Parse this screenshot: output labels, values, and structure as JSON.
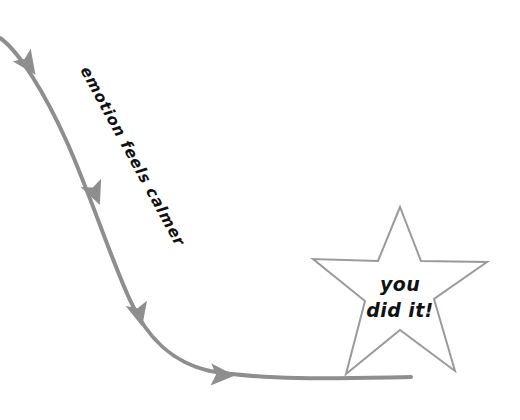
{
  "canvas": {
    "width": 520,
    "height": 420,
    "background_color": "#ffffff"
  },
  "flow": {
    "label": "emotion feels calmer",
    "label_rotation_degrees": 61.5,
    "label_anchor_x": 80,
    "label_anchor_y": 70,
    "line_color": "#8e8e8e",
    "line_width": 4,
    "arrowhead_color": "#8e8e8e",
    "arrowhead_count": 4,
    "path": "M0,38 C20,52 46,96 66,140 C88,188 112,262 130,300 C146,336 170,362 210,371 C270,381 350,378 411,377",
    "arrowheads": [
      {
        "name": "arrowhead-1",
        "x": 28,
        "y": 64,
        "angle": 55
      },
      {
        "name": "arrowhead-2",
        "x": 95,
        "y": 193,
        "angle": 68
      },
      {
        "name": "arrowhead-3",
        "x": 139,
        "y": 314,
        "angle": 76
      },
      {
        "name": "arrowhead-4",
        "x": 222,
        "y": 375,
        "angle": 2
      }
    ]
  },
  "star": {
    "label_line1": "you",
    "label_line2": "did it!",
    "outline_color": "#9a9a9a",
    "fill_color": "#ffffff",
    "stroke_width": 2,
    "center_x": 400,
    "center_y": 290,
    "outer_radius": 88,
    "inner_radius": 36,
    "points": "400,207 421,261 487,262 434,299 455,371 400,330 346,374 365,301 313,259 378,261"
  }
}
